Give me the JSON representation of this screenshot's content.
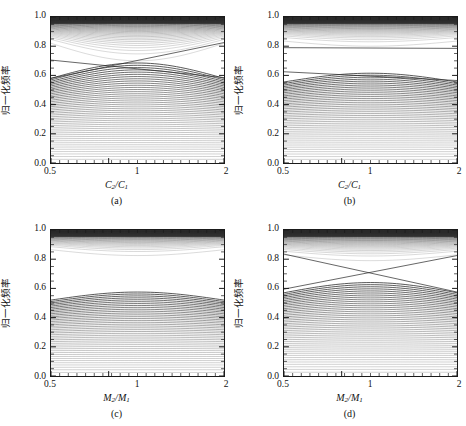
{
  "figure": {
    "width": 466,
    "height": 426,
    "background": "#ffffff",
    "line_color": "#2b2b2b",
    "axis_color": "#1a1a1a"
  },
  "chart_data": [
    {
      "id": "a",
      "type": "line",
      "title": "",
      "panel_label": "(a)",
      "xlabel": "C₂/C₁",
      "xlabel_main": "C",
      "xlabel_sub1": "2",
      "xlabel_sub2": "1",
      "ylabel": "归一化频率",
      "xlim": [
        0.5,
        2
      ],
      "ylim": [
        0.0,
        1.0
      ],
      "xticks": [
        0.5,
        1,
        2
      ],
      "xticklabels": [
        "0.5",
        "1",
        "2"
      ],
      "yticks": [
        0.0,
        0.2,
        0.4,
        0.6,
        0.8,
        1.0
      ],
      "yticklabels": [
        "0.0",
        "0.2",
        "0.4",
        "0.6",
        "0.8",
        "1.0"
      ],
      "grid": false,
      "legend": "none",
      "n_bands_lower": 46,
      "n_bands_upper": 34,
      "lower_band_top_edge": 0.58,
      "lower_band_top_center": 0.685,
      "upper_band_bottom_edge": 0.82,
      "upper_band_bottom_center": 0.7,
      "gap_edge_low": 0.58,
      "gap_edge_high": 0.82,
      "defect_lines": [
        {
          "name": "defect-down",
          "x0": 0.5,
          "y0": 0.705,
          "x1": 2.0,
          "y1": 0.585
        },
        {
          "name": "defect-up",
          "x0": 0.5,
          "y0": 0.58,
          "x1": 2.0,
          "y1": 0.825
        }
      ]
    },
    {
      "id": "b",
      "type": "line",
      "title": "",
      "panel_label": "(b)",
      "xlabel": "C₂/C₁",
      "xlabel_main": "C",
      "xlabel_sub1": "2",
      "xlabel_sub2": "1",
      "ylabel": "归一化频率",
      "xlim": [
        0.5,
        2
      ],
      "ylim": [
        0.0,
        1.0
      ],
      "xticks": [
        0.5,
        1,
        2
      ],
      "xticklabels": [
        "0.5",
        "1",
        "2"
      ],
      "yticks": [
        0.0,
        0.2,
        0.4,
        0.6,
        0.8,
        1.0
      ],
      "yticklabels": [
        "0.0",
        "0.2",
        "0.4",
        "0.6",
        "0.8",
        "1.0"
      ],
      "grid": false,
      "legend": "none",
      "n_bands_lower": 44,
      "n_bands_upper": 34,
      "lower_band_top_edge": 0.555,
      "lower_band_top_center": 0.615,
      "upper_band_bottom_edge": 0.835,
      "upper_band_bottom_center": 0.8,
      "gap_edge_low": 0.555,
      "gap_edge_high": 0.835,
      "defect_lines": [
        {
          "name": "defect-upper-flat",
          "x0": 0.5,
          "y0": 0.79,
          "x1": 2.0,
          "y1": 0.785
        },
        {
          "name": "defect-lower-flat",
          "x0": 0.5,
          "y0": 0.625,
          "x1": 2.0,
          "y1": 0.565
        }
      ]
    },
    {
      "id": "c",
      "type": "line",
      "title": "",
      "panel_label": "(c)",
      "xlabel": "M₂/M₁",
      "xlabel_main": "M",
      "xlabel_sub1": "2",
      "xlabel_sub2": "1",
      "ylabel": "归一化频率",
      "xlim": [
        0.5,
        2
      ],
      "ylim": [
        0.0,
        1.0
      ],
      "xticks": [
        0.5,
        1,
        2
      ],
      "xticklabels": [
        "0.5",
        "1",
        "2"
      ],
      "yticks": [
        0.0,
        0.2,
        0.4,
        0.6,
        0.8,
        1.0
      ],
      "yticklabels": [
        "0.0",
        "0.2",
        "0.4",
        "0.6",
        "0.8",
        "1.0"
      ],
      "grid": false,
      "legend": "none",
      "n_bands_lower": 42,
      "n_bands_upper": 32,
      "lower_band_top_edge": 0.52,
      "lower_band_top_center": 0.575,
      "upper_band_bottom_edge": 0.865,
      "upper_band_bottom_center": 0.825,
      "gap_edge_low": 0.52,
      "gap_edge_high": 0.865,
      "defect_lines": []
    },
    {
      "id": "d",
      "type": "line",
      "title": "",
      "panel_label": "(d)",
      "xlabel": "M₂/M₁",
      "xlabel_main": "M",
      "xlabel_sub1": "2",
      "xlabel_sub2": "1",
      "ylabel": "归一化频率",
      "xlim": [
        0.5,
        2
      ],
      "ylim": [
        0.0,
        1.0
      ],
      "xticks": [
        0.5,
        1,
        2
      ],
      "xticklabels": [
        "0.5",
        "1",
        "2"
      ],
      "yticks": [
        0.0,
        0.2,
        0.4,
        0.6,
        0.8,
        1.0
      ],
      "yticklabels": [
        "0.0",
        "0.2",
        "0.4",
        "0.6",
        "0.8",
        "1.0"
      ],
      "grid": false,
      "legend": "none",
      "n_bands_lower": 44,
      "n_bands_upper": 34,
      "lower_band_top_edge": 0.57,
      "lower_band_top_center": 0.64,
      "upper_band_bottom_edge": 0.83,
      "upper_band_bottom_center": 0.79,
      "gap_edge_low": 0.57,
      "gap_edge_high": 0.83,
      "defect_lines": [
        {
          "name": "defect-down",
          "x0": 0.5,
          "y0": 0.835,
          "x1": 2.0,
          "y1": 0.575
        },
        {
          "name": "defect-up",
          "x0": 0.5,
          "y0": 0.595,
          "x1": 2.0,
          "y1": 0.825
        }
      ]
    }
  ]
}
